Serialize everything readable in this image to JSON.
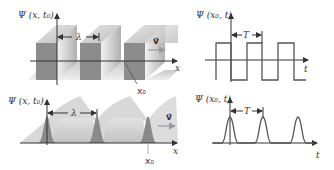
{
  "panels": {
    "top_left": {
      "title": "Square wave in space (3D view)",
      "ylabel": "Ψ (x, t₀)",
      "xlabel": "x",
      "wavelength_label": "λ",
      "velocity_label": "v⃗",
      "marker_label": "x₀"
    },
    "top_right": {
      "title": "Square wave in time at fixed position",
      "ylabel": "Ψ (x₀, t)",
      "xlabel": "t",
      "period_label": "T"
    },
    "bottom_left": {
      "title": "Pulse train in space (3D view)",
      "ylabel": "Ψ (x, t₀)",
      "xlabel": "x",
      "wavelength_label": "λ",
      "velocity_label": "v⃗",
      "marker_label": "x₀"
    },
    "bottom_right": {
      "title": "Pulse train in time at fixed position",
      "ylabel": "Ψ (x₀, t)",
      "xlabel": "t",
      "period_label": "T"
    }
  },
  "colors": {
    "axis": "#333333",
    "wave_line": "#555555",
    "face_dark": "#8a8a8a",
    "face_light": "#d9d9d9",
    "face_mid": "#b5b5b5"
  }
}
